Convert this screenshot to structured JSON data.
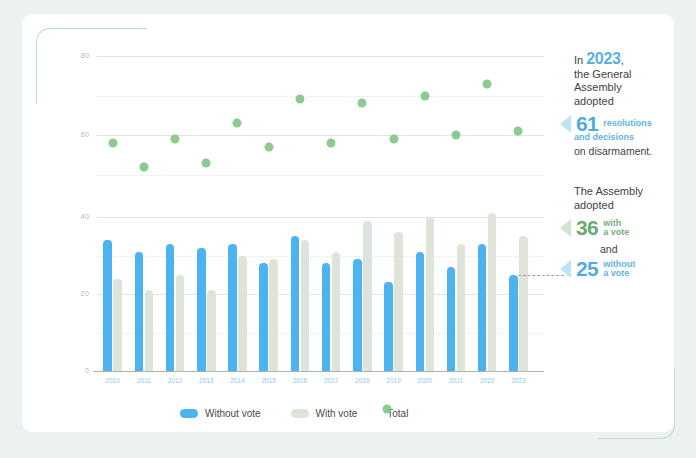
{
  "chart_data": {
    "type": "bar",
    "title": "",
    "subtitle": "",
    "xlabel": "",
    "ylabel": "",
    "categories": [
      "2010",
      "2011",
      "2012",
      "2013",
      "2014",
      "2015",
      "2016",
      "2017",
      "2018",
      "2019",
      "2020",
      "2021",
      "2022",
      "2023"
    ],
    "series": [
      {
        "name": "Without vote",
        "type": "bar",
        "color": "#4cb2f0",
        "values": [
          34,
          31,
          33,
          32,
          33,
          28,
          35,
          28,
          29,
          23,
          31,
          27,
          33,
          25
        ]
      },
      {
        "name": "With vote",
        "type": "bar",
        "color": "#dde4da",
        "values": [
          24,
          21,
          25,
          21,
          30,
          29,
          34,
          31,
          39,
          36,
          40,
          33,
          41,
          35
        ]
      },
      {
        "name": "Total",
        "type": "scatter",
        "color": "#7cc47f",
        "values": [
          58,
          52,
          59,
          53,
          63,
          57,
          69,
          58,
          68,
          59,
          70,
          60,
          73,
          61
        ]
      }
    ],
    "bar_axis": {
      "ylim": [
        0,
        40
      ],
      "ticks": [
        0,
        20,
        40
      ],
      "grid": true
    },
    "scatter_axis": {
      "ylim": [
        40,
        80
      ],
      "ticks": [
        60,
        80
      ],
      "grid": true
    },
    "legend_position": "bottom"
  },
  "legend": {
    "items": [
      {
        "label": "Without vote",
        "color": "#4cb2f0",
        "shape": "pill"
      },
      {
        "label": "With vote",
        "color": "#dde4da",
        "shape": "pill"
      },
      {
        "label": "Total",
        "color": "#7cc47f",
        "shape": "dot"
      }
    ]
  },
  "annotations": {
    "top": {
      "line1_prefix": "In",
      "year": "2023",
      "line1_suffix": ",",
      "line2": "the General",
      "line3": "Assembly",
      "line4": "adopted",
      "big_number": "61",
      "big_sub_line1": "resolutions",
      "big_sub_line2": "and decisions",
      "tail": "on disarmament."
    },
    "bottom": {
      "line1": "The Assembly",
      "line2": "adopted",
      "with_number": "36",
      "with_sub_line1": "with",
      "with_sub_line2": "a vote",
      "conjunction": "and",
      "without_number": "25",
      "without_sub_line1": "without",
      "without_sub_line2": "a vote"
    }
  },
  "colors": {
    "blue": "#4cb2f0",
    "sage": "#dde4da",
    "green": "#7cc47f",
    "accent_green_frame": "#b9dfc4",
    "background": "#eef1f2",
    "card": "#ffffff"
  }
}
